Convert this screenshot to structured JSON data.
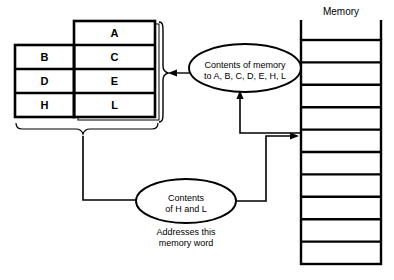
{
  "diagram": {
    "colors": {
      "stroke": "#000000",
      "background": "#ffffff",
      "text": "#000000"
    },
    "register_table": {
      "left_column": [
        {
          "label": ""
        },
        {
          "label": "B"
        },
        {
          "label": "D"
        },
        {
          "label": "H"
        }
      ],
      "right_column": [
        {
          "label": "A"
        },
        {
          "label": "C"
        },
        {
          "label": "E"
        },
        {
          "label": "L"
        }
      ]
    },
    "memory": {
      "title": "Memory",
      "cell_count": 10
    },
    "bubbles": [
      {
        "name": "contents-of-memory-bubble",
        "line1": "Contents of memory",
        "line2": "to A, B, C, D, E, H, L"
      },
      {
        "name": "contents-of-hl-bubble",
        "line1": "Contents",
        "line2": "of H and L"
      }
    ],
    "caption": {
      "line1": "Addresses this",
      "line2": "memory word"
    }
  }
}
